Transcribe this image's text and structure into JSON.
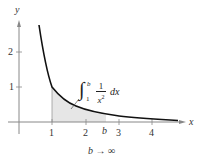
{
  "diagram": {
    "function": "1/x^2",
    "axes": {
      "x_label": "x",
      "y_label": "y",
      "x_ticks": [
        "1",
        "2",
        "3",
        "4"
      ],
      "y_ticks": [
        "1",
        "2"
      ],
      "b_marker": "b"
    },
    "shaded_region": "area under y = 1/x^2 from x = 1 to x = b",
    "integral": {
      "sign": "∫",
      "upper": "b",
      "lower": "1",
      "numerator": "1",
      "denominator": "x",
      "exponent": "2",
      "differential": "dx"
    },
    "limit_label": "b → ∞",
    "colors": {
      "curve": "#111111",
      "axes": "#888888",
      "shade": "#e6e6e6"
    }
  }
}
